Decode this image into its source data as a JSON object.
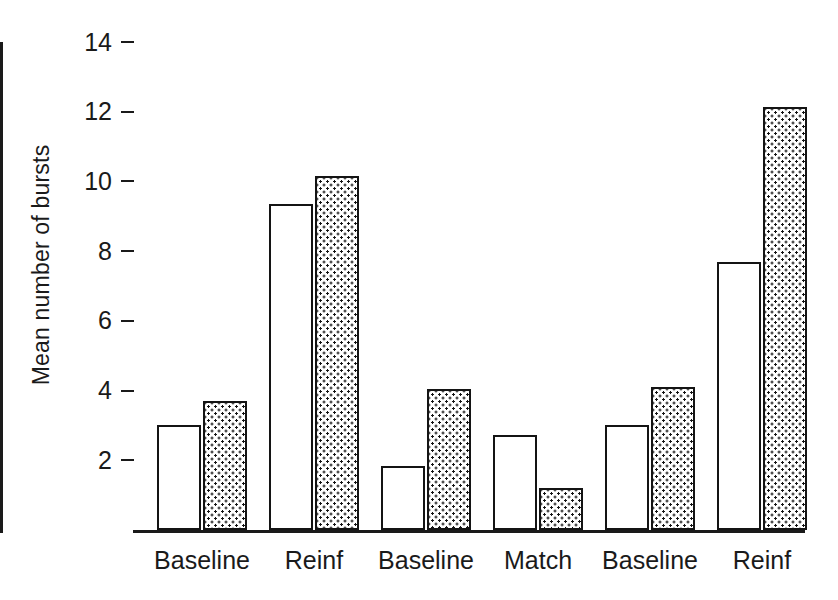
{
  "chart_data": {
    "type": "bar",
    "title": "",
    "xlabel": "",
    "ylabel": "Mean number of bursts",
    "categories": [
      "Baseline",
      "Reinf",
      "Baseline",
      "Match",
      "Baseline",
      "Reinf"
    ],
    "series": [
      {
        "name": "open",
        "fill": "white",
        "values": [
          3.0,
          9.35,
          1.85,
          2.72,
          3.0,
          7.68
        ]
      },
      {
        "name": "stippled",
        "fill": "dotted",
        "values": [
          3.7,
          10.15,
          4.05,
          1.2,
          4.1,
          12.15
        ]
      }
    ],
    "ylim": [
      0,
      14
    ],
    "yticks": [
      2,
      4,
      6,
      8,
      10,
      12,
      14
    ],
    "ytick_labels": [
      "2",
      "4",
      "6",
      "8",
      "10",
      "12",
      "14"
    ],
    "grid": false,
    "legend": "none",
    "colors": {
      "line": "#141414",
      "open_fill": "#ffffff",
      "stipple_fill": "#ffffff",
      "stipple_dot": "#141414",
      "text": "#1a1a1a",
      "background": "#ffffff"
    }
  }
}
